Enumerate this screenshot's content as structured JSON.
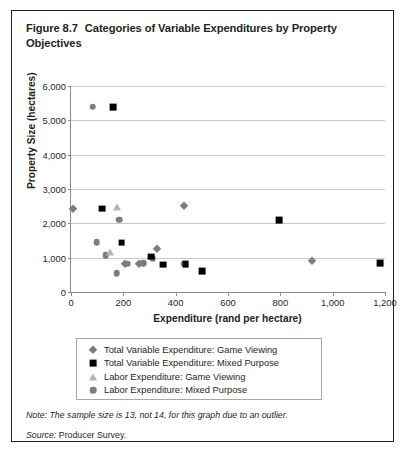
{
  "figure": {
    "number": "Figure 8.7",
    "title": "Categories of Variable Expenditures by Property Objectives",
    "note_label": "Note:",
    "note_text": "The sample size is 13, not 14, for this graph due to an outlier.",
    "source_label": "Source:",
    "source_text": "Producer Survey."
  },
  "colors": {
    "gray_marker": "#7d7d7d",
    "light_gray_marker": "#b3b3b3",
    "black_marker": "#000000",
    "gridline": "#c9c9c9",
    "axis": "#8a8a8a",
    "text": "#231f20",
    "border": "#231f20"
  },
  "chart_data": {
    "type": "scatter",
    "title": "Categories of Variable Expenditures by Property Objectives",
    "xlabel": "Expenditure (rand per hectare)",
    "ylabel": "Property Size (hectares)",
    "xlim": [
      0,
      1200
    ],
    "ylim": [
      0,
      6000
    ],
    "xticks": [
      0,
      200,
      400,
      600,
      800,
      1000,
      1200
    ],
    "xtick_labels": [
      "0",
      "200",
      "400",
      "600",
      "800",
      "1,000",
      "1,200"
    ],
    "yticks": [
      0,
      1000,
      2000,
      3000,
      4000,
      5000,
      6000
    ],
    "ytick_labels": [
      "0",
      "1,000",
      "2,000",
      "3,000",
      "4,000",
      "5,000",
      "6,000"
    ],
    "grid": "horizontal",
    "legend_position": "below-axes",
    "series": [
      {
        "name": "Total Variable Expenditure: Game Viewing",
        "marker": "diamond",
        "color": "#7d7d7d",
        "points": [
          {
            "x": 8,
            "y": 2420
          },
          {
            "x": 258,
            "y": 810
          },
          {
            "x": 330,
            "y": 1250
          },
          {
            "x": 430,
            "y": 2500
          },
          {
            "x": 920,
            "y": 900
          },
          {
            "x": 205,
            "y": 830
          }
        ]
      },
      {
        "name": "Total Variable Expenditure: Mixed Purpose",
        "marker": "square",
        "color": "#000000",
        "points": [
          {
            "x": 160,
            "y": 5390
          },
          {
            "x": 118,
            "y": 2430
          },
          {
            "x": 193,
            "y": 1440
          },
          {
            "x": 305,
            "y": 1030
          },
          {
            "x": 352,
            "y": 800
          },
          {
            "x": 438,
            "y": 820
          },
          {
            "x": 500,
            "y": 610
          },
          {
            "x": 795,
            "y": 2100
          },
          {
            "x": 1180,
            "y": 840
          }
        ]
      },
      {
        "name": "Labor Expenditure: Game Viewing",
        "marker": "triangle",
        "color": "#b3b3b3",
        "points": [
          {
            "x": 175,
            "y": 2490
          },
          {
            "x": 150,
            "y": 1160
          }
        ]
      },
      {
        "name": "Labor Expenditure: Mixed Purpose",
        "marker": "circle",
        "color": "#7d7d7d",
        "points": [
          {
            "x": 83,
            "y": 5400
          },
          {
            "x": 98,
            "y": 1450
          },
          {
            "x": 132,
            "y": 1070
          },
          {
            "x": 175,
            "y": 550
          },
          {
            "x": 185,
            "y": 2110
          },
          {
            "x": 215,
            "y": 820
          },
          {
            "x": 275,
            "y": 840
          },
          {
            "x": 313,
            "y": 990
          },
          {
            "x": 430,
            "y": 830
          }
        ]
      }
    ]
  }
}
